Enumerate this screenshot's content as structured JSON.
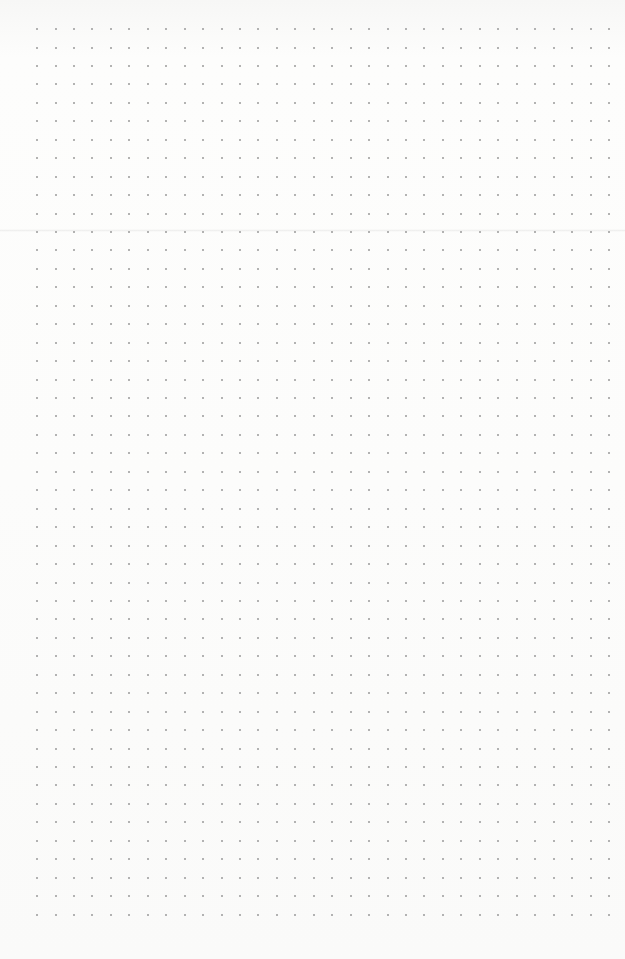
{
  "paper": {
    "style": "dot-grid",
    "background_color": "#fbfbfa",
    "dot_color": "#9a9a9a",
    "dot_spacing_px": 18.45,
    "origin_x": 37,
    "origin_y": 29,
    "columns": 32,
    "rows": 49,
    "fold_line_y": 230
  }
}
